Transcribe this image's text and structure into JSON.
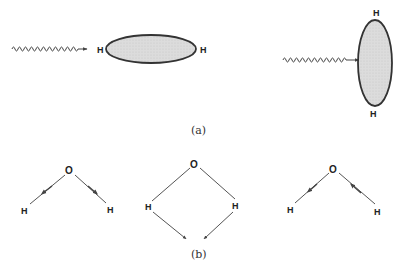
{
  "panel_a": {
    "caption": "(a)",
    "horizontal_molecule": {
      "left_atom": "H",
      "right_atom": "H",
      "fill": "#dcdcdc",
      "stroke": "#333333"
    },
    "vertical_molecule": {
      "top_atom": "H",
      "bottom_atom": "H",
      "fill": "#dcdcdc",
      "stroke": "#333333"
    },
    "photon_icons": [
      "wavy-arrow-icon",
      "wavy-arrow-icon"
    ]
  },
  "panel_b": {
    "caption": "(b)",
    "modes": [
      {
        "name": "symmetric-stretch",
        "center_atom": "O",
        "left_atom": "H",
        "right_atom": "H"
      },
      {
        "name": "bend",
        "center_atom": "O",
        "left_atom": "H",
        "right_atom": "H"
      },
      {
        "name": "antisymmetric-stretch",
        "center_atom": "O",
        "left_atom": "H",
        "right_atom": "H"
      }
    ]
  },
  "colors": {
    "line": "#555555",
    "text": "#222222"
  }
}
